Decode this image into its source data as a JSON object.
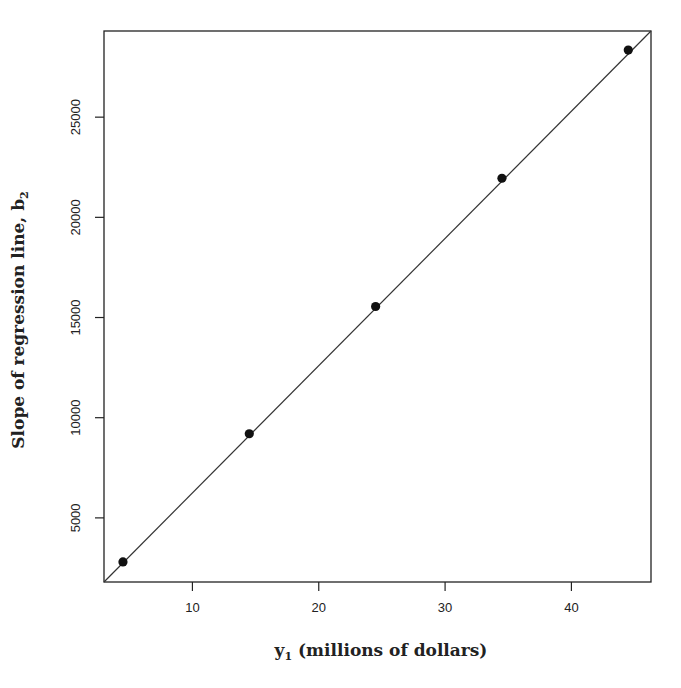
{
  "chart_data": {
    "type": "scatter",
    "title": "",
    "xlabel": "y₁ (millions of dollars)",
    "xlabel_parts": {
      "main": "y",
      "sub": "1",
      "rest": " (millions of dollars)"
    },
    "ylabel": "Slope of regression line, b₂",
    "ylabel_parts": {
      "main": "Slope of regression line, b",
      "sub": "2"
    },
    "xlim": [
      3.0,
      46.3
    ],
    "ylim": [
      1800,
      29300
    ],
    "xticks": [
      10,
      20,
      30,
      40
    ],
    "xtick_labels": [
      "10",
      "20",
      "30",
      "40"
    ],
    "yticks": [
      5000,
      10000,
      15000,
      20000,
      25000
    ],
    "ytick_labels": [
      "5000",
      "10000",
      "15000",
      "20000",
      "25000"
    ],
    "grid": false,
    "legend": null,
    "points": {
      "x": [
        4.5,
        14.5,
        24.5,
        34.5,
        44.5
      ],
      "y": [
        2800,
        9200,
        15550,
        21950,
        28350
      ]
    },
    "fit_line": {
      "type": "line",
      "from": [
        3.0,
        1800
      ],
      "to": [
        46.3,
        29300
      ],
      "description": "diagonal reference line through the points"
    },
    "colors": {
      "points": "#111111",
      "line": "#333333",
      "frame": "#222222"
    }
  }
}
